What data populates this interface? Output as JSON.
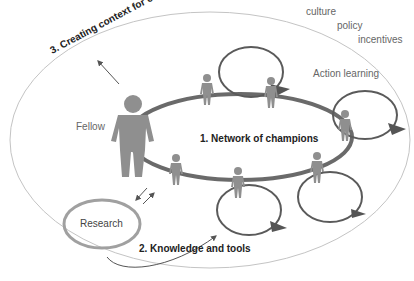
{
  "diagram": {
    "title_context": "3. Creating context for change",
    "context_factors": [
      "culture",
      "policy",
      "incentives"
    ],
    "fellow_label": "Fellow",
    "network_label": "1. Network of champions",
    "action_learning_label": "Action learning",
    "research_label": "Research",
    "knowledge_label": "2. Knowledge and tools"
  },
  "colors": {
    "outer_ellipse": "#bbbbbb",
    "network_ring": "#6b6b6b",
    "figure": "#8f8f8f",
    "loop": "#5a5a5a",
    "research_ring": "#9a9a9a",
    "text_dark": "#222222",
    "text_soft": "#666666"
  }
}
